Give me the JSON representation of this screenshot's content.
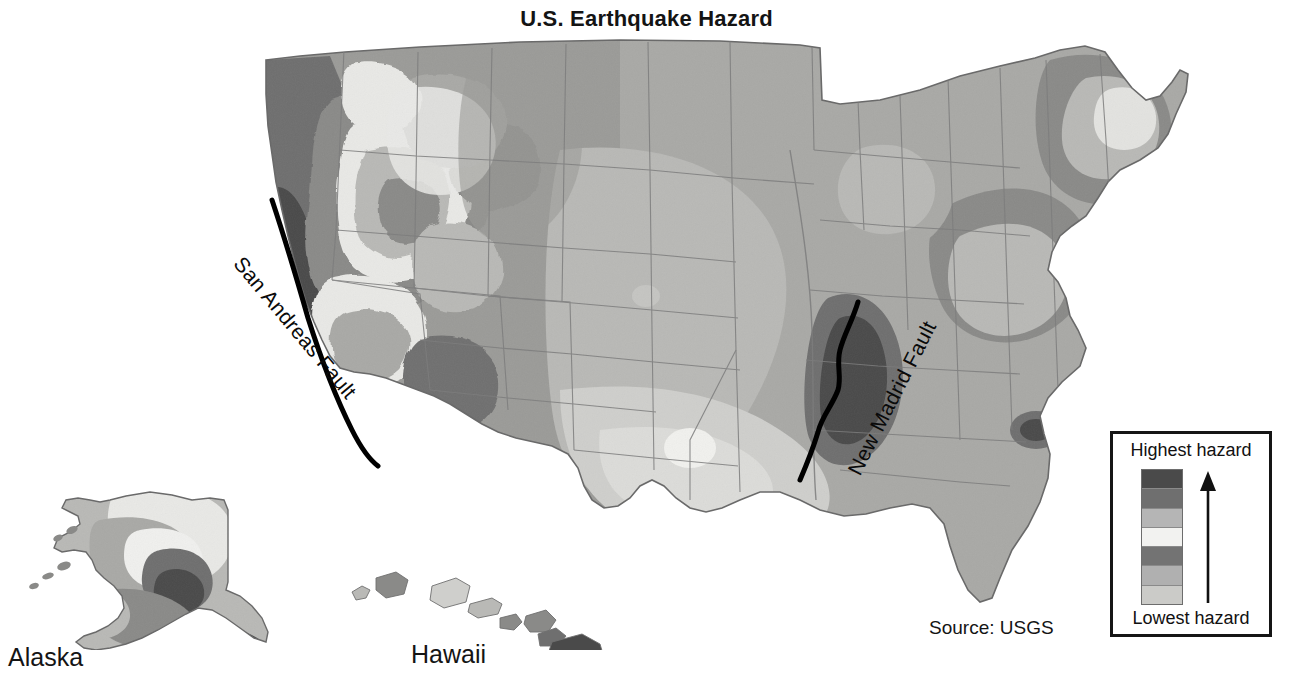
{
  "title": "U.S. Earthquake Hazard",
  "source": "Source: USGS",
  "annotations": {
    "san_andreas": "San Andreas Fault",
    "new_madrid": "New Madrid Fault"
  },
  "insets": {
    "alaska": "Alaska",
    "hawaii": "Hawaii"
  },
  "legend": {
    "high_label": "Highest hazard",
    "low_label": "Lowest hazard",
    "arrow": "up-arrow",
    "border_color": "#151515",
    "swatches": [
      {
        "name": "band-7-highest",
        "color": "#4a4a4a"
      },
      {
        "name": "band-6",
        "color": "#6f6f6f"
      },
      {
        "name": "band-5",
        "color": "#b5b5b5"
      },
      {
        "name": "band-4",
        "color": "#f2f2f0"
      },
      {
        "name": "band-3",
        "color": "#737373"
      },
      {
        "name": "band-2",
        "color": "#b0b0b0"
      },
      {
        "name": "band-1-lowest",
        "color": "#cbcbc8"
      }
    ]
  },
  "map": {
    "background": "#ffffff",
    "outline_color": "#6a6a6a",
    "state_border_color": "#7d7d7d",
    "fault_line_color": "#000000",
    "palette": {
      "lowest": "#cfcfcc",
      "low": "#b9b9b6",
      "low_mid": "#a9a9a6",
      "mid": "#9b9b98",
      "mid_high": "#8a8a88",
      "high": "#6f6f6f",
      "highest": "#4a4a4a",
      "pale": "#e9e9e6",
      "white_band": "#f6f6f4"
    }
  },
  "chart_data": {
    "type": "map",
    "title": "U.S. Earthquake Hazard",
    "variable": "Seismic hazard (peak ground acceleration)",
    "scale_type": "ordinal-sequential",
    "classes": 7,
    "class_order_low_to_high": [
      "Lowest hazard",
      "",
      "",
      "",
      "",
      "",
      "Highest hazard"
    ],
    "legend_colors_high_to_low": [
      "#4a4a4a",
      "#6f6f6f",
      "#b5b5b5",
      "#f2f2f0",
      "#737373",
      "#b0b0b0",
      "#cbcbc8"
    ],
    "annotated_features": [
      {
        "label": "San Andreas Fault",
        "region": "California coast",
        "hazard": "highest"
      },
      {
        "label": "New Madrid Fault",
        "region": "Missouri / Arkansas / Tennessee",
        "hazard": "highest"
      }
    ],
    "insets": [
      {
        "name": "Alaska",
        "hazard_range": "low to highest"
      },
      {
        "name": "Hawaii",
        "hazard_range": "low to highest"
      }
    ],
    "regional_hazard": [
      {
        "region": "California",
        "hazard": "highest"
      },
      {
        "region": "Pacific Northwest",
        "hazard": "high"
      },
      {
        "region": "Nevada / Utah Basin and Range",
        "hazard": "high"
      },
      {
        "region": "Rocky Mountains",
        "hazard": "moderate"
      },
      {
        "region": "Great Plains",
        "hazard": "low"
      },
      {
        "region": "Texas / Gulf Coast",
        "hazard": "lowest"
      },
      {
        "region": "New Madrid seismic zone",
        "hazard": "highest"
      },
      {
        "region": "Charleston, South Carolina",
        "hazard": "highest"
      },
      {
        "region": "Northeast / New England",
        "hazard": "moderate"
      },
      {
        "region": "Florida",
        "hazard": "lowest"
      }
    ],
    "source": "USGS",
    "legend_position": "bottom-right"
  }
}
